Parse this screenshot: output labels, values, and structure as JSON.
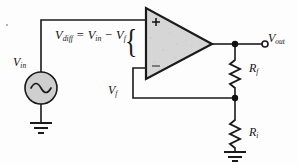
{
  "diagram": {
    "background_color": "#fdfdfd",
    "wire_color": "#1a1a1a",
    "opamp_fill": "#d6d6d6"
  },
  "labels": {
    "v_in": {
      "symbol": "V",
      "subscript": "in",
      "name": "input-voltage"
    },
    "v_out": {
      "symbol": "V",
      "subscript": "out",
      "name": "output-voltage"
    },
    "v_f": {
      "symbol": "V",
      "subscript": "f",
      "name": "feedback-voltage"
    },
    "r_f": {
      "symbol": "R",
      "subscript": "f",
      "name": "feedback-resistor"
    },
    "r_i": {
      "symbol": "R",
      "subscript": "i",
      "name": "input-resistor"
    },
    "brace": "{"
  },
  "equation": {
    "lhs_symbol": "V",
    "lhs_subscript": "diff",
    "equals": " = ",
    "term1_symbol": "V",
    "term1_subscript": "in",
    "operator": " − ",
    "term2_symbol": "V",
    "term2_subscript": "f",
    "plain": "Vdiff = Vin - Vf"
  },
  "opamp": {
    "plus_label": "+",
    "minus_label": "−",
    "name": "operational-amplifier"
  },
  "components": [
    {
      "type": "ac-source",
      "label": "V_in",
      "name": "ac-voltage-source"
    },
    {
      "type": "ground",
      "name": "ground-source"
    },
    {
      "type": "opamp",
      "name": "operational-amplifier"
    },
    {
      "type": "resistor",
      "label": "R_f",
      "name": "feedback-resistor"
    },
    {
      "type": "resistor",
      "label": "R_i",
      "name": "input-resistor"
    },
    {
      "type": "ground",
      "name": "ground-ri"
    },
    {
      "type": "terminal",
      "label": "V_out",
      "name": "output-terminal"
    }
  ]
}
